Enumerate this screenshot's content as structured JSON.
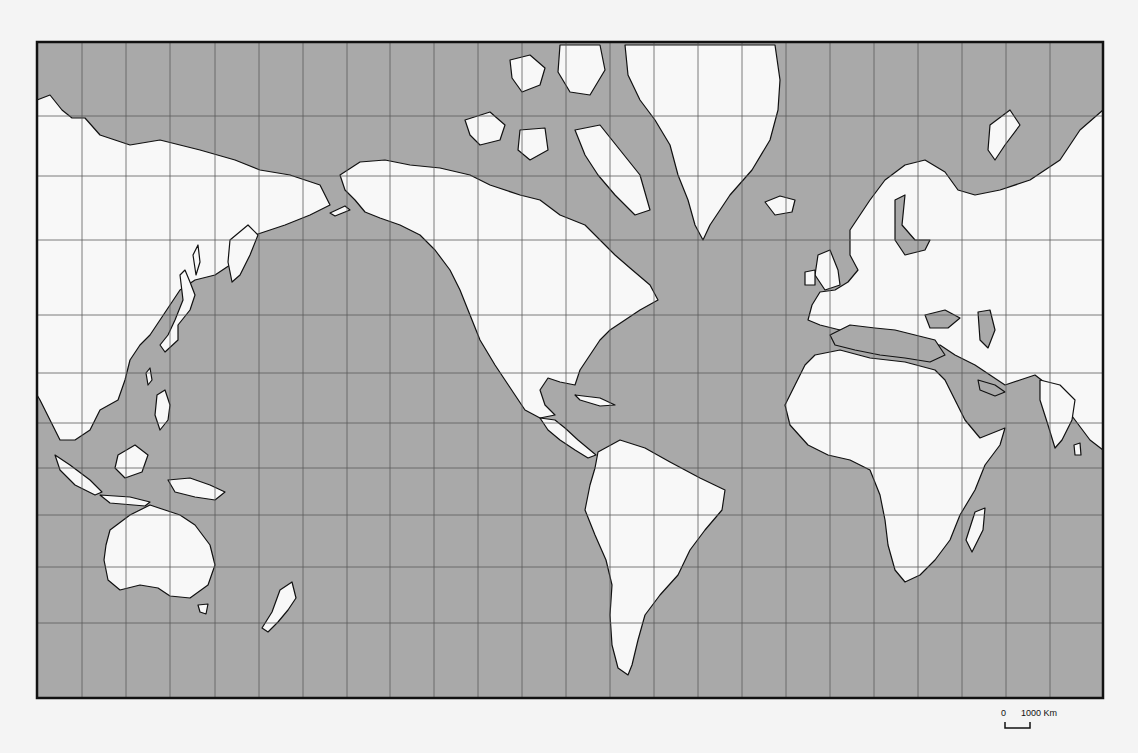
{
  "map": {
    "type": "world-outline-map",
    "projection": "Mercator (Pacific-centered)",
    "colors": {
      "page_background": "#f4f4f4",
      "ocean": "#a9a9a9",
      "land": "#f8f8f8",
      "coastline": "#111111",
      "grid": "#5c5c5c",
      "frame": "#111111"
    },
    "frame": {
      "x": 37,
      "y": 42,
      "width": 1066,
      "height": 656
    },
    "grid": {
      "vertical_lines_x": [
        82,
        126,
        170,
        215,
        259,
        303,
        347,
        390,
        434,
        478,
        522,
        566,
        610,
        654,
        698,
        742,
        786,
        830,
        874,
        918,
        962,
        1006,
        1050
      ],
      "horizontal_lines_y": [
        116,
        176,
        240,
        315,
        373,
        423,
        468,
        515,
        567,
        623
      ]
    },
    "scale_bar": {
      "zero_label": "0",
      "distance_label": "1000 Km",
      "bar_x1": 1005,
      "bar_x2": 1030,
      "bar_y": 727
    }
  }
}
